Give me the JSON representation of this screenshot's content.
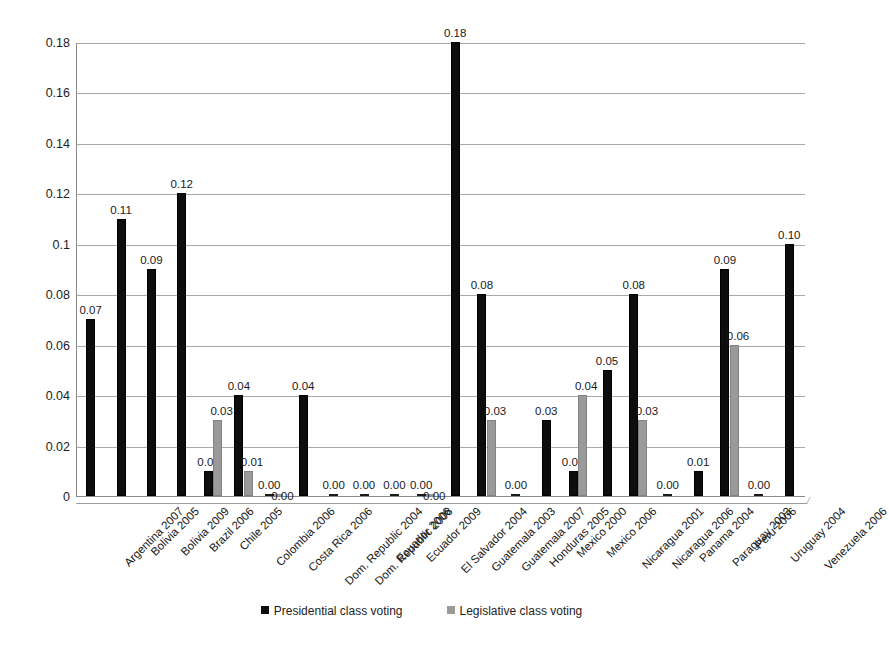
{
  "chart_data": {
    "type": "bar",
    "title": "",
    "xlabel": "",
    "ylabel": "",
    "ylim": [
      0,
      0.18
    ],
    "grid": true,
    "legend_position": "bottom",
    "ytick_labels": [
      "0",
      "0.02",
      "0.04",
      "0.06",
      "0.08",
      "0.1",
      "0.12",
      "0.14",
      "0.16",
      "0.18"
    ],
    "ytick_values": [
      0,
      0.02,
      0.04,
      0.06,
      0.08,
      0.1,
      0.12,
      0.14,
      0.16,
      0.18
    ],
    "categories": [
      "Argentina 2007",
      "Bolivia 2005",
      "Bolivia 2009",
      "Brazil 2006",
      "Chile 2005",
      "Colombia 2006",
      "Costa Rica 2006",
      "Dom. Republic 2004",
      "Dom. Republic 2008",
      "Ecuador 2006",
      "Ecuador 2009",
      "El Salvador 2004",
      "Guatemala 2003",
      "Guatemala 2007",
      "Honduras 2005",
      "Mexico 2000",
      "Mexico 2006",
      "Nicaragua 2001",
      "Nicaragua 2006",
      "Panama 2004",
      "Paraguay 2003",
      "Peru 2006",
      "Uruguay 2004",
      "Venezuela 2006"
    ],
    "series": [
      {
        "name": "Presidential class voting",
        "color": "#0d0d0d",
        "values": [
          0.07,
          0.11,
          0.09,
          0.12,
          0.01,
          0.04,
          0.0,
          0.04,
          0.0,
          0.0,
          0.0,
          0.0,
          0.18,
          0.08,
          0.0,
          0.03,
          0.01,
          0.05,
          0.08,
          0.0,
          0.01,
          0.09,
          0.0,
          0.1
        ],
        "labels": [
          "0.07",
          "0.11",
          "0.09",
          "0.12",
          "0.01",
          "0.04",
          "0.00",
          "0.04",
          "0.00",
          "0.00",
          "0.00",
          "0.00",
          "0.18",
          "0.08",
          "0.00",
          "0.03",
          "0.01",
          "0.05",
          "0.08",
          "0.00",
          "0.01",
          "0.09",
          "0.00",
          "0.10"
        ]
      },
      {
        "name": "Legislative class voting",
        "color": "#9a9a9a",
        "values": [
          null,
          null,
          null,
          null,
          0.03,
          0.01,
          0.0,
          null,
          null,
          null,
          null,
          0.0,
          null,
          0.03,
          null,
          null,
          0.04,
          null,
          0.03,
          null,
          null,
          0.06,
          null,
          null
        ],
        "labels": [
          null,
          null,
          null,
          null,
          "0.03",
          "0.01",
          "0.00",
          null,
          null,
          null,
          null,
          "0.00",
          null,
          "0.03",
          null,
          null,
          "0.04",
          null,
          "0.03",
          null,
          null,
          "0.06",
          null,
          null
        ]
      }
    ]
  },
  "legend": {
    "entries": [
      {
        "label": "Presidential class voting",
        "swatch": "presidential"
      },
      {
        "label": "Legislative class voting",
        "swatch": "legislative"
      }
    ]
  }
}
